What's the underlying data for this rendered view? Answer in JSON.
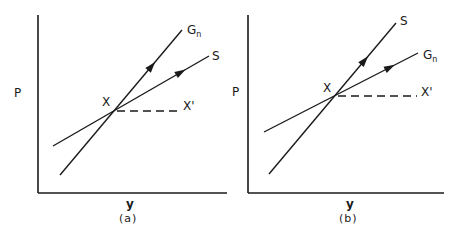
{
  "figure": {
    "ink_color": "#1a1a1a",
    "background": "#ffffff",
    "panels": [
      {
        "id": "a",
        "caption": "(a)",
        "axes": {
          "origin": [
            38,
            193
          ],
          "y_top": 15,
          "x_right": 227,
          "y_label": "P",
          "y_label_pos": [
            14,
            97
          ],
          "x_label": "y",
          "x_label_pos": [
            126,
            208
          ],
          "caption_pos": [
            119,
            222
          ]
        },
        "intersection": {
          "label": "X",
          "point": [
            114,
            111
          ],
          "label_pos": [
            102,
            106
          ]
        },
        "dashed": {
          "label": "X'",
          "from": [
            114,
            111
          ],
          "to": [
            178,
            111
          ],
          "label_pos": [
            183,
            110
          ]
        },
        "lines": [
          {
            "name": "G",
            "subscript": "n",
            "from": [
              60,
              175
            ],
            "to": [
              182,
              30
            ],
            "arrow_at": 0.78,
            "label_pos": [
              187,
              34
            ]
          },
          {
            "name": "S",
            "subscript": "",
            "from": [
              53,
              146
            ],
            "to": [
              209,
              56
            ],
            "arrow_at": 0.85,
            "label_pos": [
              212,
              60
            ]
          }
        ]
      },
      {
        "id": "b",
        "caption": "(b)",
        "axes": {
          "origin": [
            248,
            193
          ],
          "y_top": 15,
          "x_right": 444,
          "y_label": "P",
          "y_label_pos": [
            232,
            96
          ],
          "x_label": "y",
          "x_label_pos": [
            346,
            208
          ],
          "caption_pos": [
            339,
            222
          ]
        },
        "intersection": {
          "label": "X",
          "point": [
            335,
            96
          ],
          "label_pos": [
            323,
            92
          ]
        },
        "dashed": {
          "label": "X'",
          "from": [
            335,
            96
          ],
          "to": [
            417,
            96
          ],
          "label_pos": [
            421,
            96
          ]
        },
        "lines": [
          {
            "name": "S",
            "subscript": "",
            "from": [
              269,
              174
            ],
            "to": [
              396,
              23
            ],
            "arrow_at": 0.78,
            "label_pos": [
              400,
              25
            ]
          },
          {
            "name": "G",
            "subscript": "n",
            "from": [
              264,
              132
            ],
            "to": [
              418,
              53
            ],
            "arrow_at": 0.85,
            "label_pos": [
              423,
              59
            ]
          }
        ]
      }
    ]
  }
}
